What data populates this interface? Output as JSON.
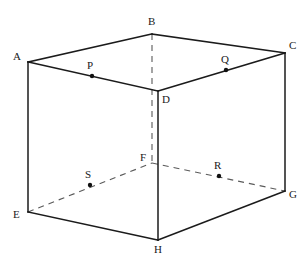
{
  "figure": {
    "type": "geometry-diagram",
    "shape": "cuboid",
    "stroke_color_visible": "#1b1b1b",
    "stroke_color_hidden": "#5a5a5a",
    "background_color": "#ffffff"
  },
  "vertices": [
    {
      "id": "A",
      "label": "A",
      "x": 28,
      "y": 62,
      "label_x": 13,
      "label_y": 51,
      "hidden": false
    },
    {
      "id": "B",
      "label": "B",
      "x": 152,
      "y": 34,
      "label_x": 148,
      "label_y": 16,
      "hidden": true
    },
    {
      "id": "C",
      "label": "C",
      "x": 285,
      "y": 53,
      "label_x": 289,
      "label_y": 40,
      "hidden": false
    },
    {
      "id": "D",
      "label": "D",
      "x": 158,
      "y": 91,
      "label_x": 162,
      "label_y": 94,
      "hidden": false
    },
    {
      "id": "E",
      "label": "E",
      "x": 28,
      "y": 212,
      "label_x": 13,
      "label_y": 209,
      "hidden": false
    },
    {
      "id": "F",
      "label": "F",
      "x": 152,
      "y": 163,
      "label_x": 140,
      "label_y": 152,
      "hidden": true
    },
    {
      "id": "G",
      "label": "G",
      "x": 285,
      "y": 191,
      "label_x": 289,
      "label_y": 189,
      "hidden": false
    },
    {
      "id": "H",
      "label": "H",
      "x": 158,
      "y": 240,
      "label_x": 154,
      "label_y": 244,
      "hidden": false
    }
  ],
  "points": [
    {
      "id": "P",
      "label": "P",
      "x": 92,
      "y": 76,
      "label_x": 87,
      "label_y": 60,
      "on_segment": "A-D"
    },
    {
      "id": "Q",
      "label": "Q",
      "x": 226,
      "y": 70,
      "label_x": 221,
      "label_y": 54,
      "on_segment": "D-C"
    },
    {
      "id": "R",
      "label": "R",
      "x": 219,
      "y": 176,
      "label_x": 214,
      "label_y": 160,
      "on_segment": "F-G"
    },
    {
      "id": "S",
      "label": "S",
      "x": 90,
      "y": 185,
      "label_x": 85,
      "label_y": 169,
      "on_segment": "E-F"
    }
  ],
  "edges": [
    {
      "from": "A",
      "to": "B",
      "hidden": false
    },
    {
      "from": "B",
      "to": "C",
      "hidden": false
    },
    {
      "from": "C",
      "to": "D",
      "hidden": false
    },
    {
      "from": "D",
      "to": "A",
      "hidden": false
    },
    {
      "from": "A",
      "to": "E",
      "hidden": false
    },
    {
      "from": "C",
      "to": "G",
      "hidden": false
    },
    {
      "from": "D",
      "to": "H",
      "hidden": false
    },
    {
      "from": "B",
      "to": "F",
      "hidden": true
    },
    {
      "from": "E",
      "to": "F",
      "hidden": true
    },
    {
      "from": "F",
      "to": "G",
      "hidden": true
    },
    {
      "from": "E",
      "to": "H",
      "hidden": false
    },
    {
      "from": "H",
      "to": "G",
      "hidden": false
    }
  ]
}
